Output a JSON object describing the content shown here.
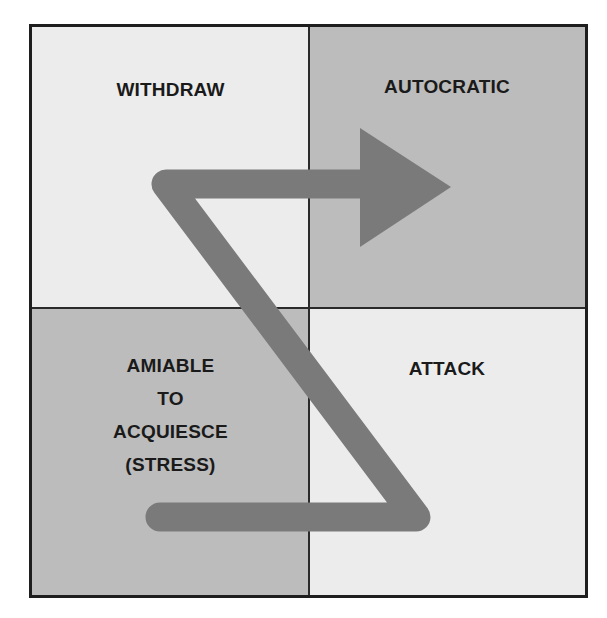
{
  "diagram": {
    "quadrants": {
      "top_left": {
        "label": "WITHDRAW",
        "shade": "light"
      },
      "top_right": {
        "label": "AUTOCRATIC",
        "shade": "dark"
      },
      "bottom_left": {
        "label_lines": [
          "AMIABLE",
          "TO",
          "ACQUIESCE",
          "(STRESS)"
        ],
        "shade": "dark"
      },
      "bottom_right": {
        "label": "ATTACK",
        "shade": "light"
      }
    },
    "path": {
      "description": "Z-shaped arrow from bottom-left through top-left into top-right",
      "icon": "z-arrow-icon",
      "color": "#7a7a7a"
    },
    "colors": {
      "light_cell": "#ececec",
      "dark_cell": "#bcbcbc",
      "border": "#1e1e1e",
      "arrow": "#7a7a7a",
      "text": "#1a1a1a"
    }
  }
}
